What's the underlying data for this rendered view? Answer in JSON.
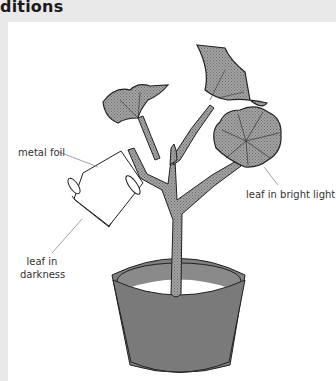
{
  "heading": {
    "text": "ditions"
  },
  "diagram": {
    "labels": {
      "metal_foil": "metal foil",
      "leaf_in_darkness": "leaf in darkness",
      "leaf_in_darkness_line1": "leaf in",
      "leaf_in_darkness_line2": "darkness",
      "leaf_in_bright_light": "leaf in bright light"
    },
    "colors": {
      "background": "#e9e9e9",
      "panel": "#ffffff",
      "plant_fill": "#9a9a9a",
      "pot_fill": "#7d7d7d",
      "outline": "#222222",
      "label_text": "#333333",
      "leader_line": "#888888"
    }
  }
}
